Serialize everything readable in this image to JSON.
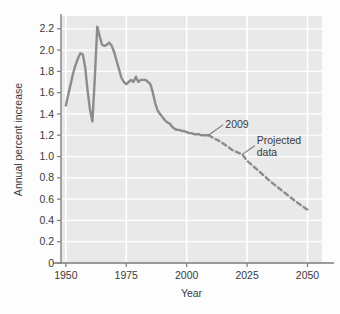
{
  "chart_data": {
    "type": "line",
    "title": "",
    "xlabel": "Year",
    "ylabel": "Annual percent increase",
    "xlim": [
      1948,
      2056
    ],
    "ylim": [
      0,
      2.32
    ],
    "grid": true,
    "legend": "none",
    "xticks": [
      1950,
      1975,
      2000,
      2025,
      2050
    ],
    "xtick_labels": [
      "1950",
      "1975",
      "2000",
      "2025",
      "2050"
    ],
    "yticks": [
      0,
      0.2,
      0.4,
      0.6,
      0.8,
      1.0,
      1.2,
      1.4,
      1.6,
      1.8,
      2.0,
      2.2
    ],
    "ytick_labels": [
      "0",
      "0.2",
      "0.4",
      "0.6",
      "0.8",
      "1.0",
      "1.2",
      "1.4",
      "1.6",
      "1.8",
      "2.0",
      "2.2"
    ],
    "gridline_years": [
      1950,
      1975,
      2000,
      2025,
      2050
    ],
    "series": [
      {
        "name": "Historical data",
        "style": "solid",
        "color": "#8c8c8c",
        "x": [
          1950,
          1951,
          1952,
          1953,
          1954,
          1955,
          1956,
          1957,
          1958,
          1959,
          1960,
          1961,
          1962,
          1963,
          1964,
          1965,
          1966,
          1967,
          1968,
          1969,
          1970,
          1971,
          1972,
          1973,
          1974,
          1975,
          1976,
          1977,
          1978,
          1979,
          1980,
          1981,
          1982,
          1983,
          1984,
          1985,
          1986,
          1987,
          1988,
          1989,
          1990,
          1991,
          1992,
          1993,
          1994,
          1995,
          1996,
          1997,
          1998,
          1999,
          2000,
          2001,
          2002,
          2003,
          2004,
          2005,
          2006,
          2007,
          2008,
          2009
        ],
        "y": [
          1.48,
          1.58,
          1.68,
          1.78,
          1.86,
          1.92,
          1.97,
          1.96,
          1.84,
          1.62,
          1.44,
          1.33,
          1.74,
          2.22,
          2.13,
          2.05,
          2.04,
          2.05,
          2.07,
          2.04,
          1.98,
          1.9,
          1.82,
          1.74,
          1.7,
          1.68,
          1.7,
          1.72,
          1.7,
          1.75,
          1.7,
          1.72,
          1.72,
          1.72,
          1.7,
          1.68,
          1.6,
          1.5,
          1.43,
          1.4,
          1.37,
          1.34,
          1.32,
          1.31,
          1.28,
          1.26,
          1.25,
          1.25,
          1.24,
          1.24,
          1.23,
          1.22,
          1.22,
          1.21,
          1.21,
          1.21,
          1.2,
          1.2,
          1.2,
          1.2
        ]
      },
      {
        "name": "Projected data",
        "style": "dashed",
        "color": "#8c8c8c",
        "x": [
          2009,
          2014,
          2019,
          2023,
          2025,
          2030,
          2035,
          2040,
          2045,
          2050
        ],
        "y": [
          1.2,
          1.14,
          1.06,
          1.02,
          0.96,
          0.86,
          0.76,
          0.67,
          0.58,
          0.5
        ]
      }
    ],
    "annotations": [
      {
        "label": "2009",
        "point_x": 2009,
        "point_y": 1.2,
        "text_x": 2016,
        "text_y": 1.3
      },
      {
        "label_line1": "Projected",
        "label_line2": "data",
        "point_x": 2023,
        "point_y": 1.02,
        "text_x": 2029,
        "text_y": 1.12
      }
    ],
    "colors": {
      "plot_background": "#e9e9e9",
      "gridline": "#ffffff",
      "line": "#8c8c8c",
      "axis": "#7a7a7a",
      "text": "#3a3a3a",
      "figure_background": "#fdfdfd"
    }
  }
}
